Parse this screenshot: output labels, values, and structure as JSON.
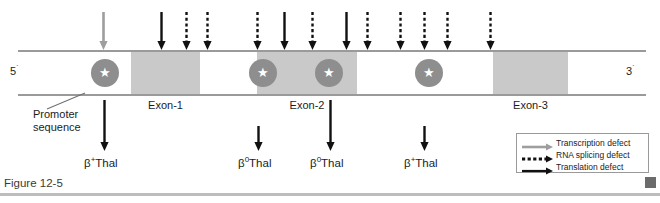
{
  "figure": {
    "caption": "Figure 12-5",
    "footer_marker": "square-marker"
  },
  "gene": {
    "five_prime_label": "5",
    "five_prime_prime": "´",
    "three_prime_label": "3",
    "three_prime_prime": "´",
    "exons": [
      {
        "label": "Exon-1",
        "x": 131,
        "width": 69
      },
      {
        "label": "Exon-2",
        "x": 257,
        "width": 100
      },
      {
        "label": "Exon-3",
        "x": 493,
        "width": 75
      }
    ],
    "ribosome_markers": [
      {
        "name": "star-marker-1",
        "glyph": "★",
        "x": 91
      },
      {
        "name": "star-marker-2",
        "glyph": "★",
        "x": 249
      },
      {
        "name": "star-marker-3",
        "glyph": "★",
        "x": 315
      },
      {
        "name": "star-marker-4",
        "glyph": "★",
        "x": 415
      }
    ]
  },
  "promoter": {
    "line1": "Promoter",
    "line2": "sequence"
  },
  "top_arrows": [
    {
      "name": "transcription-defect-arrow",
      "type": "transcription",
      "x": 103
    },
    {
      "name": "translation-defect-arrow-1",
      "type": "translation",
      "x": 161
    },
    {
      "name": "splicing-defect-arrow-1",
      "type": "splicing",
      "x": 186
    },
    {
      "name": "splicing-defect-arrow-2",
      "type": "splicing",
      "x": 207
    },
    {
      "name": "splicing-defect-arrow-3",
      "type": "splicing",
      "x": 257
    },
    {
      "name": "translation-defect-arrow-2",
      "type": "translation",
      "x": 284
    },
    {
      "name": "splicing-defect-arrow-4",
      "type": "splicing",
      "x": 312
    },
    {
      "name": "translation-defect-arrow-3",
      "type": "translation",
      "x": 346
    },
    {
      "name": "splicing-defect-arrow-5",
      "type": "splicing",
      "x": 367
    },
    {
      "name": "splicing-defect-arrow-6",
      "type": "splicing",
      "x": 400
    },
    {
      "name": "splicing-defect-arrow-7",
      "type": "splicing",
      "x": 424
    },
    {
      "name": "splicing-defect-arrow-8",
      "type": "splicing",
      "x": 447
    },
    {
      "name": "splicing-defect-arrow-9",
      "type": "splicing",
      "x": 490
    }
  ],
  "bottom_arrows": [
    {
      "name": "mutation-arrow-bthal-plus-1",
      "x": 104,
      "top": 100
    },
    {
      "name": "mutation-arrow-bthal-zero-1",
      "x": 258,
      "top": 126
    },
    {
      "name": "mutation-arrow-bthal-zero-2",
      "x": 330,
      "top": 100
    },
    {
      "name": "mutation-arrow-bthal-plus-2",
      "x": 424,
      "top": 126
    }
  ],
  "mutation_labels": [
    {
      "name": "mutation-label-1",
      "beta": "β",
      "sup": "+",
      "rest": "Thal",
      "x": 84
    },
    {
      "name": "mutation-label-2",
      "beta": "β",
      "sup": "0",
      "rest": "Thal",
      "x": 238
    },
    {
      "name": "mutation-label-3",
      "beta": "β",
      "sup": "0",
      "rest": "Thal",
      "x": 310
    },
    {
      "name": "mutation-label-4",
      "beta": "β",
      "sup": "+",
      "rest": "Thal",
      "x": 404
    }
  ],
  "legend": {
    "items": [
      {
        "name": "legend-transcription",
        "label": "Transcription defect",
        "style": "solid-gray"
      },
      {
        "name": "legend-rna-splicing",
        "label": "RNA splicing defect",
        "style": "dashed-black"
      },
      {
        "name": "legend-translation",
        "label": "Translation defect",
        "style": "solid-black"
      }
    ]
  },
  "colors": {
    "exon_fill": "#c9c9c9",
    "bar_stroke": "#9a9a9a",
    "ribosome_fill": "#8e8e8e",
    "transcription_arrow": "#9e9e9e",
    "splicing_arrow": "#111111",
    "translation_arrow": "#111111",
    "text": "#1c1c1c"
  }
}
